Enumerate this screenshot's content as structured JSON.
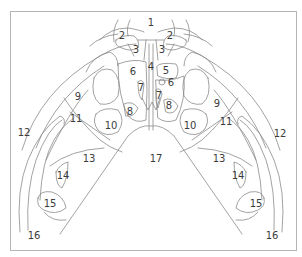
{
  "diagram": {
    "type": "anatomical-line-illustration",
    "line_color": "#8a8a8a",
    "frame_color": "#b5b5b5",
    "label_color": "#3c3c3c",
    "labels": [
      {
        "id": "l1",
        "text": "1",
        "x": 151,
        "y": 23
      },
      {
        "id": "l2a",
        "text": "2",
        "x": 122,
        "y": 36
      },
      {
        "id": "l2b",
        "text": "2",
        "x": 170,
        "y": 36
      },
      {
        "id": "l3a",
        "text": "3",
        "x": 136,
        "y": 50
      },
      {
        "id": "l3b",
        "text": "3",
        "x": 162,
        "y": 50
      },
      {
        "id": "l4",
        "text": "4",
        "x": 151,
        "y": 67
      },
      {
        "id": "l5",
        "text": "5",
        "x": 166,
        "y": 71
      },
      {
        "id": "l6a",
        "text": "6",
        "x": 133,
        "y": 72
      },
      {
        "id": "l6b",
        "text": "6",
        "x": 171,
        "y": 83
      },
      {
        "id": "l7a",
        "text": "7",
        "x": 141,
        "y": 88
      },
      {
        "id": "l7b",
        "text": "7",
        "x": 159,
        "y": 96
      },
      {
        "id": "l8a",
        "text": "8",
        "x": 130,
        "y": 112
      },
      {
        "id": "l8b",
        "text": "8",
        "x": 169,
        "y": 106
      },
      {
        "id": "l9a",
        "text": "9",
        "x": 78,
        "y": 97
      },
      {
        "id": "l9b",
        "text": "9",
        "x": 217,
        "y": 104
      },
      {
        "id": "l10a",
        "text": "10",
        "x": 111,
        "y": 126
      },
      {
        "id": "l10b",
        "text": "10",
        "x": 190,
        "y": 126
      },
      {
        "id": "l11a",
        "text": "11",
        "x": 76,
        "y": 119
      },
      {
        "id": "l11b",
        "text": "11",
        "x": 226,
        "y": 122
      },
      {
        "id": "l12a",
        "text": "12",
        "x": 24,
        "y": 133
      },
      {
        "id": "l12b",
        "text": "12",
        "x": 280,
        "y": 134
      },
      {
        "id": "l13a",
        "text": "13",
        "x": 89,
        "y": 159
      },
      {
        "id": "l13b",
        "text": "13",
        "x": 219,
        "y": 159
      },
      {
        "id": "l14a",
        "text": "14",
        "x": 63,
        "y": 176
      },
      {
        "id": "l14b",
        "text": "14",
        "x": 238,
        "y": 176
      },
      {
        "id": "l15a",
        "text": "15",
        "x": 50,
        "y": 204
      },
      {
        "id": "l15b",
        "text": "15",
        "x": 256,
        "y": 204
      },
      {
        "id": "l16a",
        "text": "16",
        "x": 34,
        "y": 236
      },
      {
        "id": "l16b",
        "text": "16",
        "x": 272,
        "y": 236
      },
      {
        "id": "l17",
        "text": "17",
        "x": 156,
        "y": 159
      }
    ]
  }
}
